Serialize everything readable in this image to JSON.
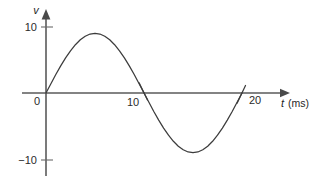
{
  "figure": {
    "background_color": "#ffffff",
    "width": 312,
    "height": 176
  },
  "axes": {
    "vertical": {
      "name": "v",
      "origin_label": "0",
      "tick_labels": [
        "10",
        "−10"
      ],
      "arrow": "up-arrow-icon"
    },
    "horizontal": {
      "name": "t",
      "unit": "(ms)",
      "tick_labels": [
        "10",
        "20"
      ],
      "arrow": "right-arrow-icon"
    }
  },
  "chart_data": {
    "type": "line",
    "title": "",
    "subtitle": "",
    "xlabel": "t (ms)",
    "ylabel": "v",
    "xlim": [
      0,
      22.5
    ],
    "ylim": [
      -13,
      13
    ],
    "xticks": [
      0,
      10,
      20
    ],
    "xticklabels": [
      "0",
      "10",
      "20"
    ],
    "yticks": [
      -10,
      0,
      10
    ],
    "yticklabels": [
      "−10",
      "0",
      "10"
    ],
    "grid": false,
    "legend": false,
    "legend_position": "none",
    "annotations": [],
    "series": [
      {
        "name": "v(t)",
        "color": "#3c3c3c",
        "equation": "v = 10 sin(2πt/20)",
        "amplitude": 10,
        "period_ms": 20,
        "x": [
          0,
          0.5,
          1,
          1.5,
          2,
          2.5,
          3,
          3.5,
          4,
          4.5,
          5,
          5.5,
          6,
          6.5,
          7,
          7.5,
          8,
          8.5,
          9,
          9.5,
          10,
          10.5,
          11,
          11.5,
          12,
          12.5,
          13,
          13.5,
          14,
          14.5,
          15,
          15.5,
          16,
          16.5,
          17,
          17.5,
          18,
          18.5,
          19,
          19.5,
          20
        ],
        "y": [
          0,
          1.56,
          3.09,
          4.54,
          5.88,
          7.07,
          8.09,
          8.91,
          9.51,
          9.88,
          10,
          9.88,
          9.51,
          8.91,
          8.09,
          7.07,
          5.88,
          4.54,
          3.09,
          1.56,
          0,
          -1.56,
          -3.09,
          -4.54,
          -5.88,
          -7.07,
          -8.09,
          -8.91,
          -9.51,
          -9.88,
          -10,
          -9.88,
          -9.51,
          -8.91,
          -8.09,
          -7.07,
          -5.88,
          -4.54,
          -3.09,
          -1.56,
          0
        ]
      }
    ],
    "key_points": {
      "start": [
        0,
        0
      ],
      "maximum": [
        5,
        10
      ],
      "zero_crossing": [
        10,
        0
      ],
      "minimum": [
        15,
        -10
      ],
      "end": [
        20,
        0
      ]
    }
  }
}
